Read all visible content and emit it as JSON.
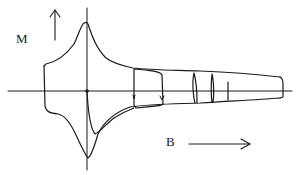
{
  "diagram": {
    "type": "magnetization hysteresis loop",
    "axis_labels": {
      "vertical": "M",
      "horizontal": "B"
    },
    "annotations": [
      {
        "id": "m-arrow",
        "description": "upward arrow indicating M axis direction"
      },
      {
        "id": "b-arrow",
        "description": "rightward arrow indicating B axis direction"
      }
    ],
    "features": [
      "major hysteresis envelope with sharp peak near B=0",
      "minor loops at increasing B",
      "envelope narrows with increasing B"
    ],
    "colors": {
      "line": "#1a1a1a",
      "background": "#ffffff"
    }
  }
}
